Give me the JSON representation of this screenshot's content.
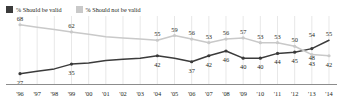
{
  "legend": {
    "items": [
      {
        "label": "% Should be valid",
        "color": "#3b3b3b",
        "key": "should_be_valid"
      },
      {
        "label": "% Should not be valid",
        "color": "#c9c9c9",
        "key": "should_not_be_valid"
      }
    ]
  },
  "chart_data": {
    "type": "line",
    "title": "",
    "xlabel": "",
    "ylabel": "",
    "ylim": [
      20,
      72
    ],
    "grid": "vertical",
    "legend_position": "top-left",
    "x": [
      "'96",
      "'97",
      "'98",
      "'99",
      "'00",
      "'01",
      "'02",
      "'03",
      "'04",
      "'05",
      "'06",
      "'07",
      "'08",
      "'09",
      "'10",
      "'11",
      "'12",
      "'13",
      "'14"
    ],
    "categories": [
      "'96",
      "'97",
      "'98",
      "'99",
      "'00",
      "'01",
      "'02",
      "'03",
      "'04",
      "'05",
      "'06",
      "'07",
      "'08",
      "'09",
      "'10",
      "'11",
      "'12",
      "'13",
      "'14"
    ],
    "series": [
      {
        "name": "% Should be valid",
        "color": "#3b3b3b",
        "values": [
          27,
          29,
          31,
          35,
          36,
          38,
          39,
          40,
          42,
          40,
          37,
          42,
          46,
          40,
          40,
          44,
          45,
          48,
          55
        ],
        "labels": [
          {
            "x": "'96",
            "value": 27,
            "pos": "below"
          },
          {
            "x": "'99",
            "value": 35,
            "pos": "below"
          },
          {
            "x": "'04",
            "value": 42,
            "pos": "below"
          },
          {
            "x": "'06",
            "value": 37,
            "pos": "below"
          },
          {
            "x": "'07",
            "value": 42,
            "pos": "below"
          },
          {
            "x": "'08",
            "value": 46,
            "pos": "below"
          },
          {
            "x": "'09",
            "value": 40,
            "pos": "below"
          },
          {
            "x": "'10",
            "value": 40,
            "pos": "below"
          },
          {
            "x": "'11",
            "value": 44,
            "pos": "below"
          },
          {
            "x": "'12",
            "value": 45,
            "pos": "below"
          },
          {
            "x": "'13",
            "value": 48,
            "pos": "below"
          }
        ]
      },
      {
        "name": "% Should not be valid",
        "color": "#c9c9c9",
        "values": [
          68,
          66,
          64,
          62,
          60,
          58,
          57,
          56,
          55,
          59,
          56,
          53,
          56,
          57,
          53,
          53,
          50,
          43,
          42
        ],
        "labels": [
          {
            "x": "'96",
            "value": 68,
            "pos": "above"
          },
          {
            "x": "'99",
            "value": 62,
            "pos": "above"
          },
          {
            "x": "'04",
            "value": 55,
            "pos": "above"
          },
          {
            "x": "'05",
            "value": 59,
            "pos": "above"
          },
          {
            "x": "'06",
            "value": 56,
            "pos": "above"
          },
          {
            "x": "'07",
            "value": 53,
            "pos": "above"
          },
          {
            "x": "'08",
            "value": 56,
            "pos": "above"
          },
          {
            "x": "'09",
            "value": 57,
            "pos": "above"
          },
          {
            "x": "'10",
            "value": 53,
            "pos": "above"
          },
          {
            "x": "'11",
            "value": 53,
            "pos": "above"
          },
          {
            "x": "'12",
            "value": 50,
            "pos": "above"
          },
          {
            "x": "'13",
            "value": 43,
            "pos": "below"
          },
          {
            "x": "'14",
            "value": 42,
            "pos": "below"
          }
        ]
      }
    ],
    "crossover_labels": [
      {
        "x": "'13",
        "value": 54,
        "series": "% Should be valid",
        "pos": "above"
      },
      {
        "x": "'14",
        "value": 55,
        "series": "% Should be valid",
        "pos": "above"
      }
    ]
  },
  "colors": {
    "dark_series": "#3b3b3b",
    "light_series": "#c9c9c9",
    "gridline": "#d8d8d8",
    "axis": "#8c8c8c",
    "text": "#231f20",
    "background": "#ffffff"
  }
}
